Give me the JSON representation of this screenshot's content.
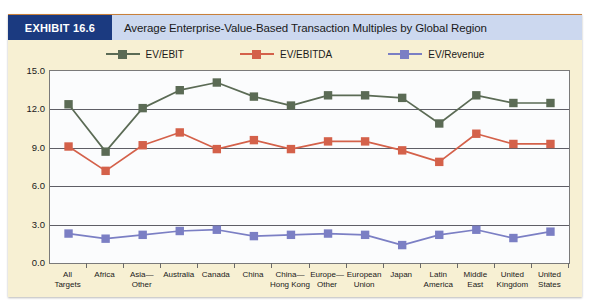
{
  "exhibit": {
    "tag": "EXHIBIT 16.6",
    "title": "Average Enterprise-Value-Based Transaction Multiples by Global Region"
  },
  "colors": {
    "ev_ebit": "#5b6b55",
    "ev_ebitda": "#d4614a",
    "ev_revenue": "#7b7fc4",
    "exhibit_tag_bg": "#1b3a80",
    "title_bg": "#ccd8ef",
    "panel_bg": "#f7f0d3",
    "plot_bg": "#fbfcfd",
    "grid": "#5e5e66",
    "accent_rule": "#c8803a"
  },
  "legend": {
    "items": [
      {
        "label": "EV/EBIT",
        "color_key": "ev_ebit"
      },
      {
        "label": "EV/EBITDA",
        "color_key": "ev_ebitda"
      },
      {
        "label": "EV/Revenue",
        "color_key": "ev_revenue"
      }
    ]
  },
  "chart_data": {
    "type": "line",
    "title": "Average Enterprise-Value-Based Transaction Multiples by Global Region",
    "xlabel": "",
    "ylabel": "",
    "ylim": [
      0.0,
      15.0
    ],
    "yticks": [
      "0.0",
      "3.0",
      "6.0",
      "9.0",
      "12.0",
      "15.0"
    ],
    "ytick_values": [
      0.0,
      3.0,
      6.0,
      9.0,
      12.0,
      15.0
    ],
    "grid": true,
    "legend_position": "top",
    "categories": [
      "All\nTargets",
      "Africa",
      "Asia—\nOther",
      "Australia",
      "Canada",
      "China",
      "China—\nHong Kong",
      "Europe—\nOther",
      "European\nUnion",
      "Japan",
      "Latin\nAmerica",
      "Middle\nEast",
      "United\nKingdom",
      "United\nStates"
    ],
    "series": [
      {
        "name": "EV/EBIT",
        "color": "#5b6b55",
        "values": [
          12.4,
          8.7,
          12.1,
          13.5,
          14.1,
          13.0,
          12.3,
          13.1,
          13.1,
          12.9,
          10.9,
          13.1,
          12.5,
          12.5
        ]
      },
      {
        "name": "EV/EBITDA",
        "color": "#d4614a",
        "values": [
          9.1,
          7.2,
          9.2,
          10.2,
          8.9,
          9.6,
          8.9,
          9.5,
          9.5,
          8.8,
          7.9,
          10.1,
          9.3,
          9.3
        ]
      },
      {
        "name": "EV/Revenue",
        "color": "#7b7fc4",
        "values": [
          2.3,
          1.9,
          2.2,
          2.5,
          2.6,
          2.1,
          2.2,
          2.3,
          2.2,
          1.4,
          2.2,
          2.6,
          1.95,
          2.45
        ]
      }
    ]
  }
}
